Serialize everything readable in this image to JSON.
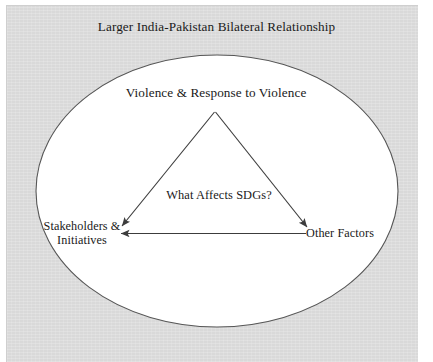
{
  "figure": {
    "title": "Larger India-Pakistan Bilateral Relationship",
    "outer_shape": "ellipse",
    "inner_shape": "triangle",
    "panel_color": "#d9d9d9",
    "ellipse_fill": "#ffffff",
    "line_color": "#3c3c3c",
    "text_color": "#191919"
  },
  "nodes": {
    "apex": "Violence & Response to Violence",
    "center": "What Affects SDGs?",
    "left_line1": "Stakeholders &",
    "left_line2": "Initiatives",
    "right": "Other Factors"
  },
  "diagram_data": {
    "type": "diagram",
    "title": "Larger India-Pakistan Bilateral Relationship",
    "container_label": "Larger India-Pakistan Bilateral Relationship",
    "center_question": "What Affects SDGs?",
    "vertices": [
      {
        "id": "violence",
        "label": "Violence & Response to Violence",
        "position": "top"
      },
      {
        "id": "stakeholders",
        "label": "Stakeholders & Initiatives",
        "position": "bottom-left"
      },
      {
        "id": "other-factors",
        "label": "Other Factors",
        "position": "bottom-right"
      }
    ],
    "edges": [
      {
        "from": "violence",
        "to": "stakeholders",
        "arrow": "single",
        "direction": "to"
      },
      {
        "from": "violence",
        "to": "other-factors",
        "arrow": "single",
        "direction": "to"
      },
      {
        "from": "other-factors",
        "to": "stakeholders",
        "arrow": "single",
        "direction": "to"
      }
    ]
  }
}
